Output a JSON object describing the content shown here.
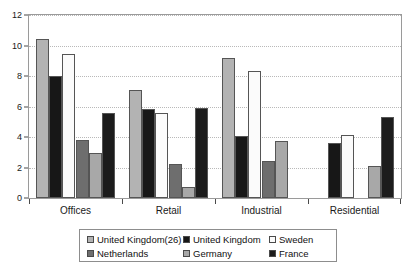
{
  "chart_data": {
    "type": "bar",
    "title": "",
    "subtitle": "",
    "xlabel": "",
    "ylabel": "",
    "categories": [
      "Offices",
      "Retail",
      "Industrial",
      "Residential"
    ],
    "ylim": [
      0,
      12
    ],
    "yticks": [
      0,
      2,
      4,
      6,
      8,
      10,
      12
    ],
    "ytick_labels": [
      "0",
      "2",
      "4",
      "6",
      "8",
      "10",
      "12"
    ],
    "grid": true,
    "grid_axis": "y",
    "legend_position": "bottom",
    "series": [
      {
        "name": "United Kingdom(26)",
        "color": "#b3b3b3",
        "values": [
          10.4,
          7.1,
          9.2,
          null
        ]
      },
      {
        "name": "United Kingdom",
        "color": "#171717",
        "values": [
          8.0,
          5.85,
          4.05,
          3.6
        ]
      },
      {
        "name": "Sweden",
        "color": "#fbfbfb",
        "values": [
          9.45,
          5.6,
          8.35,
          4.15
        ]
      },
      {
        "name": "Netherlands",
        "color": "#6e6e6e",
        "values": [
          3.8,
          2.25,
          2.45,
          null
        ]
      },
      {
        "name": "Germany",
        "color": "#a8a8a8",
        "values": [
          2.95,
          0.7,
          3.75,
          2.1
        ]
      },
      {
        "name": "France",
        "color": "#1c1c1c",
        "values": [
          5.6,
          5.9,
          null,
          5.3
        ]
      }
    ]
  },
  "legend": {
    "entries": [
      {
        "label": "United Kingdom(26)",
        "color": "#b3b3b3"
      },
      {
        "label": "United Kingdom",
        "color": "#171717"
      },
      {
        "label": "Sweden",
        "color": "#fbfbfb"
      },
      {
        "label": "Netherlands",
        "color": "#6e6e6e"
      },
      {
        "label": "Germany",
        "color": "#a8a8a8"
      },
      {
        "label": "France",
        "color": "#1c1c1c"
      }
    ]
  },
  "axes": {
    "y_tick_labels": [
      "12",
      "10",
      "8",
      "6",
      "4",
      "2",
      "0"
    ],
    "x_category_labels": [
      "Offices",
      "Retail",
      "Industrial",
      "Residential"
    ]
  }
}
